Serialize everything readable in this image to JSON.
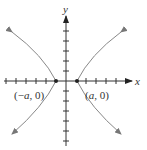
{
  "figure": {
    "type": "hyperbola-graph",
    "axes": {
      "x_label": "x",
      "y_label": "y",
      "x_ticks_each_side": 6,
      "y_ticks_each_side": 6
    },
    "vertices": [
      {
        "label": "(−a, 0)",
        "prefix": "(−",
        "var": "a",
        "suffix": ", 0)"
      },
      {
        "label": "(a, 0)",
        "prefix": "(",
        "var": "a",
        "suffix": ", 0)"
      }
    ],
    "colors": {
      "axis": "#333333",
      "curve": "#888888",
      "text": "#333333"
    }
  }
}
